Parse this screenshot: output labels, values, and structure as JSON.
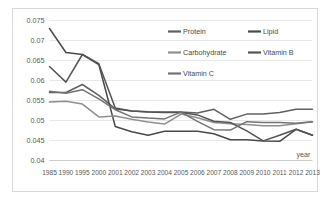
{
  "chart_data": {
    "type": "line",
    "title": "",
    "xlabel": "year",
    "ylabel": "",
    "ylim": [
      0.04,
      0.075
    ],
    "ytick_step": 0.005,
    "grid": "horizontal",
    "legend_position": "inside-top-right",
    "categories": [
      "1985",
      "1990",
      "1995",
      "2000",
      "2001",
      "2002",
      "2003",
      "2004",
      "2005",
      "2006",
      "2007",
      "2008",
      "2009",
      "2010",
      "2011",
      "2012",
      "2013"
    ],
    "ytick_labels": [
      "0.075",
      "0.07",
      "0.065",
      "0.06",
      "0.055",
      "0.05",
      "0.045",
      "0.04"
    ],
    "ytick_values": [
      0.075,
      0.07,
      0.065,
      0.06,
      0.055,
      0.05,
      0.045,
      0.04
    ],
    "series": [
      {
        "name": "Protein",
        "color": "#606060",
        "values": [
          0.057,
          0.057,
          0.059,
          0.0563,
          0.0529,
          0.0524,
          0.0522,
          0.0521,
          0.0521,
          0.0519,
          0.0528,
          0.0503,
          0.0516,
          0.0516,
          0.052,
          0.0528,
          0.0528
        ]
      },
      {
        "name": "Lipid",
        "color": "#4a4a4a",
        "values": [
          0.073,
          0.067,
          0.0665,
          0.064,
          0.0485,
          0.0472,
          0.0463,
          0.0473,
          0.0473,
          0.0473,
          0.0467,
          0.0452,
          0.0452,
          0.0449,
          0.0448,
          0.0478,
          0.0463
        ]
      },
      {
        "name": "Carbohydrate",
        "color": "#8f8f8f",
        "values": [
          0.0546,
          0.0548,
          0.0541,
          0.0509,
          0.0511,
          0.0503,
          0.0496,
          0.0491,
          0.0516,
          0.0507,
          0.0495,
          0.0492,
          0.049,
          0.0487,
          0.0487,
          0.0492,
          0.0497
        ]
      },
      {
        "name": "Vitamin B",
        "color": "#545454",
        "values": [
          0.0635,
          0.0596,
          0.0665,
          0.0642,
          0.0531,
          0.0524,
          0.0521,
          0.052,
          0.052,
          0.0514,
          0.0498,
          0.0495,
          0.0474,
          0.0449,
          0.0463,
          0.0478,
          0.0463
        ]
      },
      {
        "name": "Vitamin C",
        "color": "#737373",
        "values": [
          0.0573,
          0.0568,
          0.0577,
          0.0554,
          0.0527,
          0.0509,
          0.0506,
          0.0504,
          0.0521,
          0.0498,
          0.0477,
          0.0476,
          0.0497,
          0.0495,
          0.0495,
          0.0493,
          0.0497
        ]
      }
    ]
  },
  "legend": {
    "items": [
      {
        "label": "Protein"
      },
      {
        "label": "Lipid"
      },
      {
        "label": "Carbohydrate"
      },
      {
        "label": "Vitamin B"
      },
      {
        "label": "Vitamin C"
      }
    ]
  },
  "axis": {
    "x_title": "year"
  }
}
